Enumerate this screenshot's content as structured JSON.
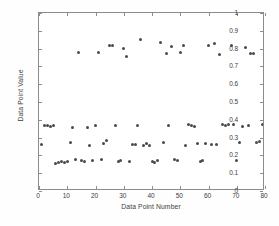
{
  "chart_data": {
    "type": "scatter",
    "title": "",
    "xlabel": "Data Point Number",
    "ylabel": "Data Point Value",
    "xlim": [
      0,
      80
    ],
    "ylim": [
      0,
      1
    ],
    "xticks": [
      0,
      10,
      20,
      30,
      40,
      50,
      60,
      70,
      80
    ],
    "xtick_labels": [
      "0",
      "10",
      "20",
      "30",
      "40",
      "50",
      "60",
      "70",
      "80"
    ],
    "yticks": [
      0,
      0.1,
      0.2,
      0.3,
      0.4,
      0.5,
      0.6,
      0.7,
      0.8,
      0.9,
      1
    ],
    "ytick_labels": [
      "0",
      "0.1",
      "0.2",
      "0.3",
      "0.4",
      "0.5",
      "0.6",
      "0.7",
      "0.8",
      "0.9",
      "1"
    ],
    "grid": false,
    "legend": false,
    "marker": "dot",
    "marker_color": "#4a4a4a",
    "frame_color": "#8c8c8c",
    "background_color": "#ffffff",
    "series": [
      {
        "name": "Data Point Value",
        "x": [
          1,
          2,
          3,
          4,
          5,
          6,
          7,
          8,
          9,
          10,
          11,
          12,
          13,
          14,
          15,
          16,
          17,
          18,
          19,
          20,
          21,
          22,
          23,
          24,
          25,
          26,
          27,
          28,
          29,
          30,
          31,
          32,
          33,
          34,
          35,
          36,
          37,
          38,
          39,
          40,
          41,
          42,
          43,
          44,
          45,
          46,
          47,
          48,
          49,
          50,
          51,
          52,
          53,
          54,
          55,
          56,
          57,
          58,
          59,
          60,
          61,
          62,
          63,
          64,
          65,
          66,
          67,
          68,
          69,
          70,
          71,
          72,
          73,
          74,
          75,
          76,
          77,
          78,
          79,
          80
        ],
        "y": [
          0.26,
          0.37,
          0.37,
          0.365,
          0.37,
          0.155,
          0.16,
          0.165,
          0.16,
          0.165,
          0.27,
          0.355,
          0.175,
          0.78,
          0.17,
          0.165,
          0.355,
          0.255,
          0.17,
          0.37,
          0.78,
          0.175,
          0.265,
          0.285,
          0.82,
          0.82,
          0.37,
          0.165,
          0.17,
          0.8,
          0.755,
          0.165,
          0.26,
          0.26,
          0.37,
          0.85,
          0.255,
          0.265,
          0.255,
          0.165,
          0.16,
          0.17,
          0.835,
          0.275,
          0.77,
          0.37,
          0.81,
          0.175,
          0.17,
          0.78,
          0.82,
          0.255,
          0.375,
          0.37,
          0.365,
          0.265,
          0.165,
          0.17,
          0.265,
          0.82,
          0.26,
          0.83,
          0.26,
          0.765,
          0.375,
          0.37,
          0.375,
          0.815,
          0.375,
          0.17,
          0.275,
          0.36,
          0.805,
          0.37,
          0.775,
          0.775,
          0.275,
          0.28,
          0.375,
          0.805
        ]
      }
    ]
  }
}
